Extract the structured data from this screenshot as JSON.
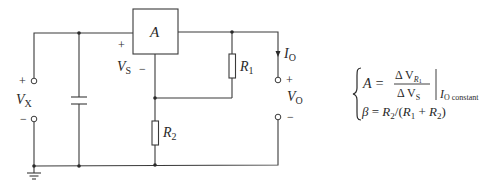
{
  "diagram": {
    "type": "circuit-schematic",
    "components": {
      "amplifier": {
        "label": "A"
      },
      "resistor_1": {
        "label": "R",
        "subscript": "1"
      },
      "resistor_2": {
        "label": "R",
        "subscript": "2"
      },
      "capacitor": {
        "label": ""
      },
      "ground": {
        "label": ""
      }
    },
    "input": {
      "label": "V",
      "subscript": "X",
      "plus": "+",
      "minus": "−"
    },
    "sense": {
      "label": "V",
      "subscript": "S",
      "plus": "+",
      "minus": "−"
    },
    "output": {
      "voltage_label": "V",
      "voltage_subscript": "O",
      "current_label": "I",
      "current_subscript": "O",
      "plus": "+",
      "minus": "−"
    },
    "equations": {
      "line1": {
        "lhs": "A =",
        "numerator": "Δ V",
        "numerator_sub": "R",
        "numerator_subsub": "1",
        "denominator": "Δ V",
        "denominator_sub": "S",
        "condition_var": "I",
        "condition_sub": "O constant"
      },
      "line2": {
        "beta": "β",
        "eq": " = ",
        "r2": "R",
        "r2_sub": "2",
        "slash": "/(",
        "r1": "R",
        "r1_sub": "1",
        "plus": " + ",
        "r2b": "R",
        "r2b_sub": "2",
        "close": ")"
      }
    }
  }
}
